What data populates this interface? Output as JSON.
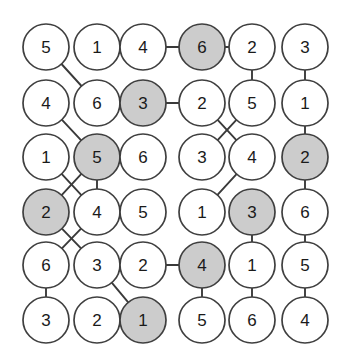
{
  "figure": {
    "name": "node-grid-graph",
    "type": "graph-diagram",
    "width": 350,
    "height": 363,
    "background_color": "#ffffff"
  },
  "style": {
    "node_fill_plain": "#ffffff",
    "node_fill_shaded": "#cccccc",
    "node_stroke": "#3f3f3f",
    "edge_stroke": "#3a3a3a",
    "label_color": "#1a1a1a",
    "node_radius": 23,
    "node_stroke_width": 1.7,
    "edge_stroke_width": 1.9,
    "label_font_size": 17
  },
  "layout": {
    "columns": 6,
    "rows": 6,
    "column_x": [
      46,
      97,
      143,
      202,
      252,
      305
    ],
    "row_y": [
      47,
      103,
      157,
      212,
      265,
      320
    ]
  },
  "nodes": [
    {
      "id": "r1c1",
      "row": 0,
      "col": 0,
      "label": "5",
      "shaded": false,
      "x": 46,
      "y": 47
    },
    {
      "id": "r1c2",
      "row": 0,
      "col": 1,
      "label": "1",
      "shaded": false,
      "x": 97,
      "y": 47
    },
    {
      "id": "r1c3",
      "row": 0,
      "col": 2,
      "label": "4",
      "shaded": false,
      "x": 143,
      "y": 47
    },
    {
      "id": "r1c4",
      "row": 0,
      "col": 3,
      "label": "6",
      "shaded": true,
      "x": 202,
      "y": 47
    },
    {
      "id": "r1c5",
      "row": 0,
      "col": 4,
      "label": "2",
      "shaded": false,
      "x": 252,
      "y": 47
    },
    {
      "id": "r1c6",
      "row": 0,
      "col": 5,
      "label": "3",
      "shaded": false,
      "x": 305,
      "y": 47
    },
    {
      "id": "r2c1",
      "row": 1,
      "col": 0,
      "label": "4",
      "shaded": false,
      "x": 46,
      "y": 103
    },
    {
      "id": "r2c2",
      "row": 1,
      "col": 1,
      "label": "6",
      "shaded": false,
      "x": 97,
      "y": 103
    },
    {
      "id": "r2c3",
      "row": 1,
      "col": 2,
      "label": "3",
      "shaded": true,
      "x": 143,
      "y": 103
    },
    {
      "id": "r2c4",
      "row": 1,
      "col": 3,
      "label": "2",
      "shaded": false,
      "x": 202,
      "y": 103
    },
    {
      "id": "r2c5",
      "row": 1,
      "col": 4,
      "label": "5",
      "shaded": false,
      "x": 252,
      "y": 103
    },
    {
      "id": "r2c6",
      "row": 1,
      "col": 5,
      "label": "1",
      "shaded": false,
      "x": 305,
      "y": 103
    },
    {
      "id": "r3c1",
      "row": 2,
      "col": 0,
      "label": "1",
      "shaded": false,
      "x": 46,
      "y": 157
    },
    {
      "id": "r3c2",
      "row": 2,
      "col": 1,
      "label": "5",
      "shaded": true,
      "x": 97,
      "y": 157
    },
    {
      "id": "r3c3",
      "row": 2,
      "col": 2,
      "label": "6",
      "shaded": false,
      "x": 143,
      "y": 157
    },
    {
      "id": "r3c4",
      "row": 2,
      "col": 3,
      "label": "3",
      "shaded": false,
      "x": 202,
      "y": 157
    },
    {
      "id": "r3c5",
      "row": 2,
      "col": 4,
      "label": "4",
      "shaded": false,
      "x": 252,
      "y": 157
    },
    {
      "id": "r3c6",
      "row": 2,
      "col": 5,
      "label": "2",
      "shaded": true,
      "x": 305,
      "y": 157
    },
    {
      "id": "r4c1",
      "row": 3,
      "col": 0,
      "label": "2",
      "shaded": true,
      "x": 46,
      "y": 212
    },
    {
      "id": "r4c2",
      "row": 3,
      "col": 1,
      "label": "4",
      "shaded": false,
      "x": 97,
      "y": 212
    },
    {
      "id": "r4c3",
      "row": 3,
      "col": 2,
      "label": "5",
      "shaded": false,
      "x": 143,
      "y": 212
    },
    {
      "id": "r4c4",
      "row": 3,
      "col": 3,
      "label": "1",
      "shaded": false,
      "x": 202,
      "y": 212
    },
    {
      "id": "r4c5",
      "row": 3,
      "col": 4,
      "label": "3",
      "shaded": true,
      "x": 252,
      "y": 212
    },
    {
      "id": "r4c6",
      "row": 3,
      "col": 5,
      "label": "6",
      "shaded": false,
      "x": 305,
      "y": 212
    },
    {
      "id": "r5c1",
      "row": 4,
      "col": 0,
      "label": "6",
      "shaded": false,
      "x": 46,
      "y": 265
    },
    {
      "id": "r5c2",
      "row": 4,
      "col": 1,
      "label": "3",
      "shaded": false,
      "x": 97,
      "y": 265
    },
    {
      "id": "r5c3",
      "row": 4,
      "col": 2,
      "label": "2",
      "shaded": false,
      "x": 143,
      "y": 265
    },
    {
      "id": "r5c4",
      "row": 4,
      "col": 3,
      "label": "4",
      "shaded": true,
      "x": 202,
      "y": 265
    },
    {
      "id": "r5c5",
      "row": 4,
      "col": 4,
      "label": "1",
      "shaded": false,
      "x": 252,
      "y": 265
    },
    {
      "id": "r5c6",
      "row": 4,
      "col": 5,
      "label": "5",
      "shaded": false,
      "x": 305,
      "y": 265
    },
    {
      "id": "r6c1",
      "row": 5,
      "col": 0,
      "label": "3",
      "shaded": false,
      "x": 46,
      "y": 320
    },
    {
      "id": "r6c2",
      "row": 5,
      "col": 1,
      "label": "2",
      "shaded": false,
      "x": 97,
      "y": 320
    },
    {
      "id": "r6c3",
      "row": 5,
      "col": 2,
      "label": "1",
      "shaded": true,
      "x": 143,
      "y": 320
    },
    {
      "id": "r6c4",
      "row": 5,
      "col": 3,
      "label": "5",
      "shaded": false,
      "x": 202,
      "y": 320
    },
    {
      "id": "r6c5",
      "row": 5,
      "col": 4,
      "label": "6",
      "shaded": false,
      "x": 252,
      "y": 320
    },
    {
      "id": "r6c6",
      "row": 5,
      "col": 5,
      "label": "4",
      "shaded": false,
      "x": 305,
      "y": 320
    }
  ],
  "edges": [
    {
      "from": "r1c2",
      "to": "r1c3",
      "kind": "horizontal"
    },
    {
      "from": "r1c3",
      "to": "r1c4",
      "kind": "horizontal"
    },
    {
      "from": "r1c4",
      "to": "r1c5",
      "kind": "horizontal"
    },
    {
      "from": "r1c1",
      "to": "r2c2",
      "kind": "diagonal"
    },
    {
      "from": "r1c5",
      "to": "r2c5",
      "kind": "vertical"
    },
    {
      "from": "r1c6",
      "to": "r2c6",
      "kind": "vertical"
    },
    {
      "from": "r2c2",
      "to": "r2c3",
      "kind": "horizontal"
    },
    {
      "from": "r2c3",
      "to": "r2c4",
      "kind": "horizontal"
    },
    {
      "from": "r2c1",
      "to": "r3c2",
      "kind": "diagonal"
    },
    {
      "from": "r2c4",
      "to": "r3c5",
      "kind": "diagonal-crossing"
    },
    {
      "from": "r2c5",
      "to": "r3c4",
      "kind": "diagonal-crossing"
    },
    {
      "from": "r2c6",
      "to": "r3c6",
      "kind": "vertical"
    },
    {
      "from": "r3c2",
      "to": "r3c3",
      "kind": "horizontal"
    },
    {
      "from": "r3c1",
      "to": "r4c2",
      "kind": "diagonal-crossing"
    },
    {
      "from": "r3c2",
      "to": "r4c1",
      "kind": "diagonal-crossing"
    },
    {
      "from": "r3c2",
      "to": "r4c2",
      "kind": "vertical"
    },
    {
      "from": "r3c5",
      "to": "r4c4",
      "kind": "diagonal"
    },
    {
      "from": "r3c6",
      "to": "r4c6",
      "kind": "vertical"
    },
    {
      "from": "r4c2",
      "to": "r4c3",
      "kind": "horizontal"
    },
    {
      "from": "r4c1",
      "to": "r5c2",
      "kind": "diagonal-crossing"
    },
    {
      "from": "r4c2",
      "to": "r5c1",
      "kind": "diagonal-crossing"
    },
    {
      "from": "r4c5",
      "to": "r5c5",
      "kind": "vertical"
    },
    {
      "from": "r4c6",
      "to": "r5c6",
      "kind": "vertical"
    },
    {
      "from": "r5c3",
      "to": "r5c4",
      "kind": "horizontal"
    },
    {
      "from": "r5c1",
      "to": "r6c1",
      "kind": "vertical"
    },
    {
      "from": "r5c2",
      "to": "r6c3",
      "kind": "diagonal"
    },
    {
      "from": "r5c4",
      "to": "r6c4",
      "kind": "vertical"
    },
    {
      "from": "r5c5",
      "to": "r6c5",
      "kind": "vertical"
    },
    {
      "from": "r5c6",
      "to": "r6c6",
      "kind": "vertical"
    }
  ]
}
